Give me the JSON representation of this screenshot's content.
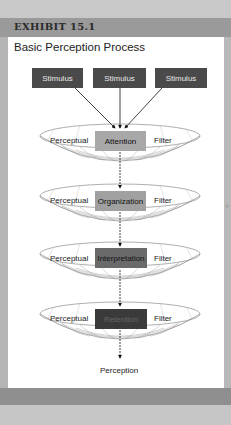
{
  "exhibit": {
    "label": "EXHIBIT 15.1"
  },
  "title": "Basic Perception Process",
  "stimuli": [
    {
      "label": "Stimulus"
    },
    {
      "label": "Stimulus"
    },
    {
      "label": "Stimulus"
    }
  ],
  "filters": [
    {
      "left": "Perceptual",
      "stage": "Attention",
      "right": "Filter",
      "stage_color": "#a8a8a8"
    },
    {
      "left": "Perceptual",
      "stage": "Organization",
      "right": "Filter",
      "stage_color": "#a0a0a0"
    },
    {
      "left": "Perceptual",
      "stage": "Interpretation",
      "right": "Filter",
      "stage_color": "#6a6a6a"
    },
    {
      "left": "Perceptual",
      "stage": "Retention",
      "right": "Filter",
      "stage_color": "#3a3a3a"
    }
  ],
  "output": {
    "label": "Perception"
  },
  "colors": {
    "stimulus_box": "#4a4a4a",
    "header_bar": "#9a9a9a",
    "background": "#c4c4c4"
  }
}
